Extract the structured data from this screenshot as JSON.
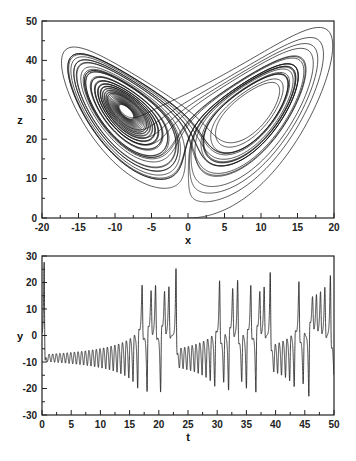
{
  "figure": {
    "line_color": "#111111",
    "axis_color": "#222222"
  },
  "simulation": {
    "system": "lorenz",
    "sigma": 10,
    "rho": 28,
    "beta": 2.6667,
    "initial": [
      0,
      1,
      0
    ],
    "dt": 0.002,
    "t_end": 50
  },
  "chart_data": [
    {
      "type": "line",
      "title": "",
      "xlabel": "x",
      "ylabel": "z",
      "xlim": [
        -20,
        20
      ],
      "ylim": [
        0,
        50
      ],
      "xticks": [
        -20,
        -15,
        -10,
        -5,
        0,
        5,
        10,
        15,
        20
      ],
      "xtick_labels": [
        "-20",
        "-15",
        "-10",
        "-5",
        "0",
        "5",
        "10",
        "15",
        "20"
      ],
      "yticks": [
        0,
        10,
        20,
        30,
        40,
        50
      ],
      "ytick_labels": [
        "0",
        "10",
        "20",
        "30",
        "40",
        "50"
      ],
      "x_minor_step": 2.5,
      "y_minor_step": 5,
      "grid": false,
      "legend": null,
      "series": [
        {
          "name": "trajectory",
          "x_var": "x",
          "y_var": "z",
          "description": "Lorenz butterfly: dense spiral around (-8.5, 27) on left lobe, looser loops around (8.5, 27) on right lobe, initial arc from (0,0) sweeping out to x≈19, z≈46"
        }
      ]
    },
    {
      "type": "line",
      "title": "",
      "xlabel": "t",
      "ylabel": "y",
      "xlim": [
        0,
        50
      ],
      "ylim": [
        -30,
        30
      ],
      "xticks": [
        0,
        5,
        10,
        15,
        20,
        25,
        30,
        35,
        40,
        45,
        50
      ],
      "xtick_labels": [
        "0",
        "5",
        "10",
        "15",
        "20",
        "25",
        "30",
        "35",
        "40",
        "45",
        "50"
      ],
      "yticks": [
        -30,
        -20,
        -10,
        0,
        10,
        20,
        30
      ],
      "ytick_labels": [
        "-30",
        "-20",
        "-10",
        "0",
        "10",
        "20",
        "30"
      ],
      "x_minor_step": 2.5,
      "y_minor_step": 5,
      "grid": false,
      "legend": null,
      "series": [
        {
          "name": "y(t)",
          "x_var": "t",
          "y_var": "y",
          "description": "initial spike to ~28 near t≈0.5, then growing oscillation around -9 from t≈1 to t≈16.5, chaotic switching between lobes afterward with peaks up to ~21 and troughs to ~-23"
        }
      ]
    }
  ],
  "layout": {
    "top": {
      "left": 42,
      "right": 334,
      "top": 21,
      "bottom": 218
    },
    "bottom": {
      "left": 42,
      "right": 334,
      "top": 256,
      "bottom": 415
    }
  }
}
